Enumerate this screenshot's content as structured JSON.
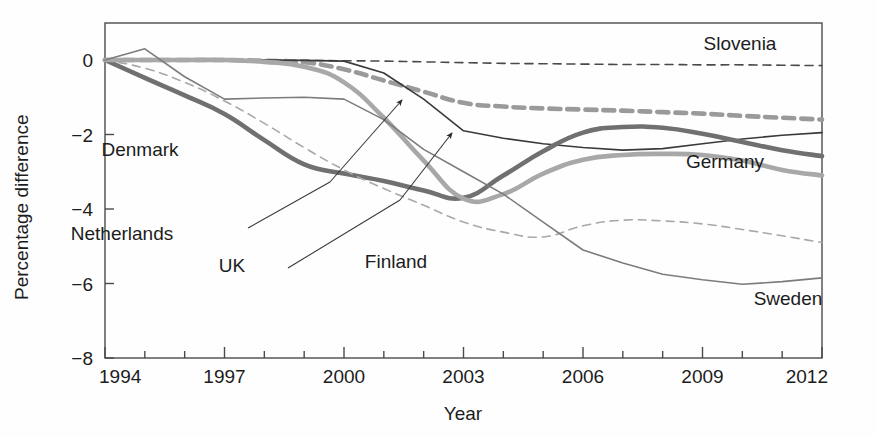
{
  "chart_data": {
    "type": "line",
    "title": "",
    "xlabel": "Year",
    "ylabel": "Percentage difference",
    "xlim": [
      1994,
      2012
    ],
    "ylim": [
      -8,
      0.8
    ],
    "grid": false,
    "legend": "inline-labels",
    "xticks": [
      1994,
      1997,
      2000,
      2003,
      2006,
      2009,
      2012
    ],
    "xtick_labels": [
      "1994",
      "1997",
      "2000",
      "2003",
      "2006",
      "2009",
      "2012"
    ],
    "xminorticks": [
      1995,
      1996,
      1998,
      1999,
      2001,
      2002,
      2004,
      2005,
      2007,
      2008,
      2010,
      2011
    ],
    "yticks": [
      0,
      -2,
      -4,
      -6,
      -8
    ],
    "ytick_labels": [
      "0",
      "−2",
      "−4",
      "−6",
      "−8"
    ],
    "x": [
      1994,
      1995,
      1996,
      1997,
      1998,
      1999,
      2000,
      2001,
      2002,
      2003,
      2004,
      2005,
      2006,
      2007,
      2008,
      2009,
      2010,
      2011,
      2012
    ],
    "series": [
      {
        "name": "Slovenia",
        "style": "dashed",
        "width": 1.6,
        "color": "#4a4a4a",
        "label_x": 740,
        "label_y": 50,
        "values": [
          0.0,
          0.0,
          0.0,
          0.0,
          0.0,
          -0.01,
          -0.02,
          -0.03,
          -0.05,
          -0.07,
          -0.09,
          -0.1,
          -0.11,
          -0.12,
          -0.12,
          -0.13,
          -0.13,
          -0.14,
          -0.15
        ]
      },
      {
        "name": "Germany",
        "style": "dashed",
        "width": 4.6,
        "color": "#9a9a9a",
        "label_x": 725,
        "label_y": 168,
        "values": [
          0.0,
          0.0,
          0.0,
          0.0,
          -0.02,
          -0.06,
          -0.25,
          -0.55,
          -0.85,
          -1.15,
          -1.25,
          -1.3,
          -1.33,
          -1.36,
          -1.4,
          -1.44,
          -1.5,
          -1.55,
          -1.6
        ]
      },
      {
        "name": "UK",
        "style": "solid",
        "width": 1.6,
        "color": "#3a3a3a",
        "label_x": 232,
        "label_y": 272,
        "values": [
          0.0,
          0.0,
          0.0,
          0.0,
          0.0,
          -0.01,
          -0.03,
          -0.35,
          -1.05,
          -1.9,
          -2.1,
          -2.25,
          -2.35,
          -2.42,
          -2.38,
          -2.25,
          -2.12,
          -2.02,
          -1.95
        ]
      },
      {
        "name": "Denmark",
        "style": "solid",
        "width": 4.6,
        "color": "#707070",
        "label_x": 140,
        "label_y": 156,
        "values": [
          0.0,
          -0.48,
          -0.95,
          -1.45,
          -2.15,
          -2.8,
          -3.05,
          -3.25,
          -3.5,
          -3.7,
          -3.1,
          -2.45,
          -1.95,
          -1.8,
          -1.82,
          -1.98,
          -2.2,
          -2.42,
          -2.58
        ]
      },
      {
        "name": "Netherlands",
        "style": "solid",
        "width": 4.6,
        "color": "#a8a8a8",
        "label_x": 122,
        "label_y": 240,
        "values": [
          0.0,
          0.0,
          0.0,
          0.0,
          -0.05,
          -0.18,
          -0.6,
          -1.55,
          -2.7,
          -3.72,
          -3.6,
          -3.05,
          -2.68,
          -2.55,
          -2.52,
          -2.55,
          -2.7,
          -2.95,
          -3.1
        ]
      },
      {
        "name": "Finland",
        "style": "dashed",
        "width": 1.6,
        "color": "#a8a8a8",
        "label_x": 396,
        "label_y": 268,
        "values": [
          0.0,
          -0.22,
          -0.6,
          -1.1,
          -1.7,
          -2.35,
          -2.95,
          -3.45,
          -3.9,
          -4.35,
          -4.62,
          -4.75,
          -4.45,
          -4.3,
          -4.32,
          -4.4,
          -4.55,
          -4.72,
          -4.9
        ]
      },
      {
        "name": "Sweden",
        "style": "solid",
        "width": 1.6,
        "color": "#7c7c7c",
        "label_x": 788,
        "label_y": 305,
        "values": [
          0.0,
          0.3,
          -0.45,
          -1.05,
          -1.02,
          -1.0,
          -1.05,
          -1.6,
          -2.4,
          -3.0,
          -3.6,
          -4.35,
          -5.1,
          -5.45,
          -5.75,
          -5.9,
          -6.02,
          -5.95,
          -5.85
        ]
      }
    ],
    "annotations": [
      {
        "name": "netherlands-leader",
        "from": [
          248,
          228
        ],
        "to": [
          330,
          182
        ],
        "arrow": false
      },
      {
        "name": "uk-leader",
        "from": [
          288,
          268
        ],
        "to": [
          400,
          200
        ],
        "arrow": false
      },
      {
        "name": "germany-arrow",
        "from": [
          330,
          182
        ],
        "to": [
          402,
          100
        ],
        "arrow": true
      },
      {
        "name": "uk-arrow",
        "from": [
          400,
          200
        ],
        "to": [
          452,
          133
        ],
        "arrow": true
      }
    ]
  }
}
